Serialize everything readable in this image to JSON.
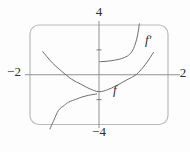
{
  "figure": {
    "background": "#fdfdfd",
    "colors": {
      "frame": "#b9b9b9",
      "axis": "#919191",
      "tick": "#7a7a7a",
      "curve": "#6e6e6e",
      "text": "#2e2e2e"
    },
    "labels": {
      "y_max": "4",
      "y_min": "−4",
      "x_min": "−2",
      "x_max": "2",
      "f": "f",
      "f_prime": "f′"
    }
  },
  "chart_data": {
    "type": "line",
    "title": "",
    "xlabel": "",
    "ylabel": "",
    "grid": false,
    "legend": "curve labels drawn inline (f near (0.5,-1.2), f′ near (1.4,2.9))",
    "frame": "rounded-rectangle viewing window",
    "xlim": [
      -2,
      2
    ],
    "ylim": [
      -4,
      4
    ],
    "x_tick_labels": [
      "−2",
      "2"
    ],
    "y_tick_labels": [
      "−4",
      "4"
    ],
    "y_axis_tick_values": [
      2,
      -2
    ],
    "series": [
      {
        "name": "f",
        "points": [
          [
            -1.63,
            1.85
          ],
          [
            -1.35,
            0.95
          ],
          [
            -1.08,
            0.28
          ],
          [
            -0.8,
            -0.35
          ],
          [
            -0.5,
            -0.8
          ],
          [
            -0.25,
            -1.15
          ],
          [
            0,
            -1.36
          ],
          [
            0.25,
            -1.2
          ],
          [
            0.5,
            -0.88
          ],
          [
            0.8,
            -0.42
          ],
          [
            1.08,
            0.02
          ],
          [
            1.35,
            0.85
          ],
          [
            1.58,
            1.8
          ]
        ]
      },
      {
        "name": "f′ (x<0)",
        "points": [
          [
            -1.42,
            -4.35
          ],
          [
            -1.31,
            -3.66
          ],
          [
            -1.17,
            -2.85
          ],
          [
            -1.0,
            -2.45
          ],
          [
            -0.88,
            -2.2
          ],
          [
            -0.65,
            -1.95
          ],
          [
            -0.5,
            -1.8
          ],
          [
            -0.3,
            -1.65
          ],
          [
            -0.07,
            -1.55
          ]
        ]
      },
      {
        "name": "f′ (x>0)",
        "points": [
          [
            0.02,
            1.05
          ],
          [
            0.2,
            1.08
          ],
          [
            0.45,
            1.17
          ],
          [
            0.65,
            1.3
          ],
          [
            0.82,
            1.5
          ],
          [
            0.95,
            1.85
          ],
          [
            1.05,
            2.45
          ],
          [
            1.12,
            3.2
          ],
          [
            1.17,
            4.1
          ]
        ]
      }
    ]
  }
}
